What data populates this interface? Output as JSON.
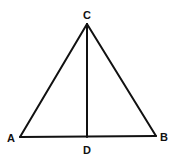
{
  "diagram": {
    "type": "geometry-triangle",
    "stroke_color": "#111111",
    "background": "#ffffff",
    "points": {
      "A": {
        "label": "A",
        "x": 20,
        "y": 137
      },
      "B": {
        "label": "B",
        "x": 156,
        "y": 136
      },
      "C": {
        "label": "C",
        "x": 87,
        "y": 24
      },
      "D": {
        "label": "D",
        "x": 87,
        "y": 137
      }
    },
    "segments": [
      "AB",
      "BC",
      "CA",
      "CD"
    ]
  }
}
